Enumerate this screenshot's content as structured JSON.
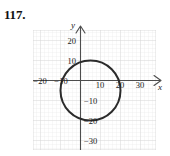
{
  "problem": {
    "number": "117."
  },
  "figure": {
    "name": "circle-graph",
    "x_axis_var": "x",
    "y_axis_var": "y"
  },
  "chart_data": {
    "type": "scatter",
    "title": "",
    "xlabel": "x",
    "ylabel": "y",
    "grid": true,
    "legend": null,
    "xlim": [
      -23.5,
      38
    ],
    "ylim": [
      -35,
      25
    ],
    "xticks": [
      -20,
      -10,
      10,
      20,
      30
    ],
    "yticks": [
      20,
      10,
      -10,
      -20,
      -30
    ],
    "xtick_labels": [
      "−20",
      "−10",
      "10",
      "20",
      "30"
    ],
    "ytick_labels": [
      "20",
      "10",
      "−10",
      "−20",
      "−30"
    ],
    "minor_grid_step": 2,
    "major_grid_step": 10,
    "shapes": [
      {
        "kind": "circle",
        "center_x": 5,
        "center_y": -5,
        "radius": 15,
        "stroke": "#2b2b2b",
        "stroke_width": 2,
        "fill": "none"
      }
    ],
    "axis_color": "#555555",
    "grid_color": "#e3e3e3",
    "grid_major_color": "#d2d2d2"
  }
}
